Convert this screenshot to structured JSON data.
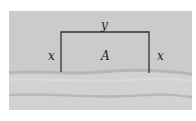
{
  "diagram": {
    "labels": {
      "top": "y",
      "left": "x",
      "right": "x",
      "area": "A"
    },
    "colors": {
      "background": "#c9c9c9",
      "river": "#d2d2d2",
      "fence": "#333333"
    }
  }
}
